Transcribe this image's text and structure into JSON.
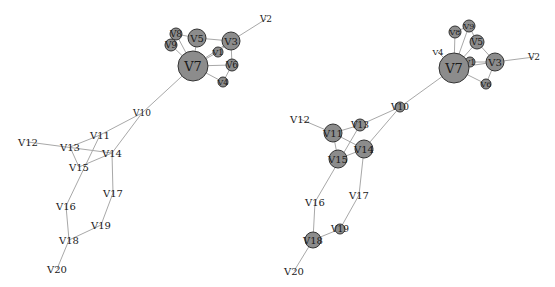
{
  "diagrams": [
    {
      "id": "left",
      "nodes": [
        {
          "name": "V2",
          "label": "V2",
          "x": 266,
          "y": 19,
          "r": 0,
          "fs": 9
        },
        {
          "name": "V3",
          "label": "V3",
          "x": 231,
          "y": 41,
          "r": 9,
          "fs": 10
        },
        {
          "name": "V5",
          "label": "V5",
          "x": 197,
          "y": 38,
          "r": 9,
          "fs": 10
        },
        {
          "name": "V8",
          "label": "V8",
          "x": 176,
          "y": 34,
          "r": 6,
          "fs": 9
        },
        {
          "name": "V9",
          "label": "V9",
          "x": 171,
          "y": 45,
          "r": 6,
          "fs": 9
        },
        {
          "name": "V1",
          "label": "V1",
          "x": 218,
          "y": 52,
          "r": 5,
          "fs": 8
        },
        {
          "name": "V6",
          "label": "V6",
          "x": 232,
          "y": 65,
          "r": 6,
          "fs": 9
        },
        {
          "name": "V4",
          "label": "V4",
          "x": 223,
          "y": 82,
          "r": 5,
          "fs": 8
        },
        {
          "name": "V7",
          "label": "V7",
          "x": 193,
          "y": 66,
          "r": 15,
          "fs": 13
        },
        {
          "name": "V10",
          "label": "V10",
          "x": 142,
          "y": 113,
          "r": 0,
          "fs": 9
        },
        {
          "name": "V11",
          "label": "V11",
          "x": 100,
          "y": 135,
          "r": 0,
          "fs": 10
        },
        {
          "name": "V12",
          "label": "V12",
          "x": 28,
          "y": 142,
          "r": 0,
          "fs": 10
        },
        {
          "name": "V13",
          "label": "V13",
          "x": 70,
          "y": 147,
          "r": 0,
          "fs": 10
        },
        {
          "name": "V14",
          "label": "V14",
          "x": 112,
          "y": 153,
          "r": 0,
          "fs": 10
        },
        {
          "name": "V15",
          "label": "V15",
          "x": 79,
          "y": 167,
          "r": 0,
          "fs": 10
        },
        {
          "name": "V17",
          "label": "V17",
          "x": 113,
          "y": 193,
          "r": 0,
          "fs": 10
        },
        {
          "name": "V16",
          "label": "V16",
          "x": 66,
          "y": 206,
          "r": 0,
          "fs": 10
        },
        {
          "name": "V19",
          "label": "V19",
          "x": 101,
          "y": 225,
          "r": 0,
          "fs": 10
        },
        {
          "name": "V18",
          "label": "V18",
          "x": 69,
          "y": 240,
          "r": 0,
          "fs": 10
        },
        {
          "name": "V20",
          "label": "V20",
          "x": 57,
          "y": 269,
          "r": 0,
          "fs": 10
        }
      ],
      "edges": [
        [
          "V7",
          "V3"
        ],
        [
          "V7",
          "V5"
        ],
        [
          "V7",
          "V8"
        ],
        [
          "V7",
          "V9"
        ],
        [
          "V7",
          "V1"
        ],
        [
          "V7",
          "V6"
        ],
        [
          "V7",
          "V4"
        ],
        [
          "V5",
          "V3"
        ],
        [
          "V8",
          "V5"
        ],
        [
          "V9",
          "V8"
        ],
        [
          "V3",
          "V6"
        ],
        [
          "V3",
          "V2"
        ],
        [
          "V6",
          "V4"
        ],
        [
          "V1",
          "V3"
        ],
        [
          "V7",
          "V10"
        ],
        [
          "V10",
          "V11"
        ],
        [
          "V10",
          "V14"
        ],
        [
          "V11",
          "V13"
        ],
        [
          "V12",
          "V14"
        ],
        [
          "V13",
          "V15"
        ],
        [
          "V14",
          "V15"
        ],
        [
          "V11",
          "V16"
        ],
        [
          "V14",
          "V17"
        ],
        [
          "V16",
          "V18"
        ],
        [
          "V17",
          "V19"
        ],
        [
          "V19",
          "V18"
        ],
        [
          "V18",
          "V20"
        ]
      ]
    },
    {
      "id": "right",
      "nodes": [
        {
          "name": "V2",
          "label": "V2",
          "x": 534,
          "y": 57,
          "r": 0,
          "fs": 9
        },
        {
          "name": "V3",
          "label": "V3",
          "x": 495,
          "y": 62,
          "r": 9,
          "fs": 10
        },
        {
          "name": "V5",
          "label": "V5",
          "x": 477,
          "y": 42,
          "r": 7,
          "fs": 9
        },
        {
          "name": "V8",
          "label": "V8",
          "x": 455,
          "y": 32,
          "r": 6,
          "fs": 8
        },
        {
          "name": "V9",
          "label": "V9",
          "x": 469,
          "y": 26,
          "r": 6,
          "fs": 8
        },
        {
          "name": "V1",
          "label": "V1",
          "x": 470,
          "y": 62,
          "r": 5,
          "fs": 8
        },
        {
          "name": "V4",
          "label": "V4",
          "x": 438,
          "y": 52,
          "r": 0,
          "fs": 8
        },
        {
          "name": "V6",
          "label": "V6",
          "x": 486,
          "y": 84,
          "r": 5,
          "fs": 8
        },
        {
          "name": "V7",
          "label": "V7",
          "x": 454,
          "y": 68,
          "r": 15,
          "fs": 13
        },
        {
          "name": "V10",
          "label": "V10",
          "x": 400,
          "y": 107,
          "r": 5,
          "fs": 9
        },
        {
          "name": "V12",
          "label": "V12",
          "x": 300,
          "y": 119,
          "r": 0,
          "fs": 10
        },
        {
          "name": "V11",
          "label": "V11",
          "x": 333,
          "y": 133,
          "r": 9,
          "fs": 10
        },
        {
          "name": "V13",
          "label": "V13",
          "x": 360,
          "y": 125,
          "r": 6,
          "fs": 9
        },
        {
          "name": "V14",
          "label": "V14",
          "x": 364,
          "y": 149,
          "r": 9,
          "fs": 10
        },
        {
          "name": "V15",
          "label": "V15",
          "x": 338,
          "y": 159,
          "r": 9,
          "fs": 10
        },
        {
          "name": "V17",
          "label": "V17",
          "x": 359,
          "y": 195,
          "r": 0,
          "fs": 10
        },
        {
          "name": "V16",
          "label": "V16",
          "x": 315,
          "y": 202,
          "r": 0,
          "fs": 10
        },
        {
          "name": "V19",
          "label": "V19",
          "x": 340,
          "y": 229,
          "r": 5,
          "fs": 9
        },
        {
          "name": "V18",
          "label": "V18",
          "x": 313,
          "y": 240,
          "r": 8,
          "fs": 10
        },
        {
          "name": "V20",
          "label": "V20",
          "x": 294,
          "y": 271,
          "r": 0,
          "fs": 10
        }
      ],
      "edges": [
        [
          "V7",
          "V3"
        ],
        [
          "V7",
          "V5"
        ],
        [
          "V7",
          "V8"
        ],
        [
          "V7",
          "V9"
        ],
        [
          "V7",
          "V1"
        ],
        [
          "V7",
          "V6"
        ],
        [
          "V7",
          "V4"
        ],
        [
          "V5",
          "V3"
        ],
        [
          "V9",
          "V5"
        ],
        [
          "V8",
          "V9"
        ],
        [
          "V1",
          "V3"
        ],
        [
          "V3",
          "V6"
        ],
        [
          "V3",
          "V2"
        ],
        [
          "V7",
          "V10"
        ],
        [
          "V10",
          "V13"
        ],
        [
          "V10",
          "V14"
        ],
        [
          "V12",
          "V11"
        ],
        [
          "V11",
          "V13"
        ],
        [
          "V11",
          "V14"
        ],
        [
          "V11",
          "V15"
        ],
        [
          "V15",
          "V14"
        ],
        [
          "V13",
          "V16"
        ],
        [
          "V14",
          "V17"
        ],
        [
          "V16",
          "V18"
        ],
        [
          "V17",
          "V19"
        ],
        [
          "V19",
          "V18"
        ],
        [
          "V18",
          "V20"
        ]
      ]
    }
  ]
}
